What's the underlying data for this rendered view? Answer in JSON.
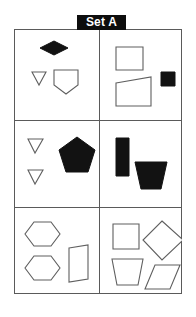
{
  "figure": {
    "title": "Set A",
    "colors": {
      "banner_background": "#0d0d0d",
      "banner_text": "#ffffff",
      "grid_line": "#5a5a5a",
      "shape_outline_stroke": "#5f5f5f",
      "shape_fill_black": "#121212",
      "shape_fill_white": "#ffffff",
      "page_background": "#ffffff"
    },
    "grid": {
      "rows": 3,
      "columns": 2,
      "x": 14,
      "y": 29,
      "width": 168,
      "height": 265,
      "divider_x": 84,
      "divider_y_1": 90,
      "divider_y_2": 177
    },
    "cells": [
      {
        "id": "cell-1",
        "position": "top-left",
        "row": 1,
        "column": 1,
        "shape_count": 3,
        "shapes": [
          {
            "name": "diamond",
            "fill": "black",
            "points": "24,17 38,10 52,17 38,24"
          },
          {
            "name": "triangle-down",
            "fill": "white",
            "points": "16,41 30,41 23,54"
          },
          {
            "name": "pentagon-shield",
            "fill": "white",
            "points": "38,39 62,39 62,54 50,63 38,54"
          }
        ]
      },
      {
        "id": "cell-2",
        "position": "top-right",
        "row": 1,
        "column": 2,
        "shape_count": 3,
        "shapes": [
          {
            "name": "rectangle",
            "fill": "white",
            "points": "16,16 43,16 43,39 16,39"
          },
          {
            "name": "square-small",
            "fill": "black",
            "points": "61,41 75,41 75,55 61,55"
          },
          {
            "name": "quadrilateral",
            "fill": "white",
            "points": "16,52 51,46 51,75 16,75"
          }
        ]
      },
      {
        "id": "cell-3",
        "position": "middle-left",
        "row": 2,
        "column": 1,
        "shape_count": 3,
        "shapes": [
          {
            "name": "triangle-down-upper",
            "fill": "white",
            "points": "12,17 27,17 19,31"
          },
          {
            "name": "triangle-down-lower",
            "fill": "white",
            "points": "12,48 27,48 19,62"
          },
          {
            "name": "pentagon",
            "fill": "black",
            "points": "61,15 79,28 72,50 50,50 43,28"
          }
        ]
      },
      {
        "id": "cell-4",
        "position": "middle-right",
        "row": 2,
        "column": 2,
        "shape_count": 2,
        "shapes": [
          {
            "name": "rectangle-tall",
            "fill": "black",
            "points": "16,16 29,16 29,54 16,54"
          },
          {
            "name": "trapezoid",
            "fill": "black",
            "points": "35,40 67,40 61,67 41,67"
          }
        ]
      },
      {
        "id": "cell-5",
        "position": "bottom-left",
        "row": 3,
        "column": 1,
        "shape_count": 3,
        "shapes": [
          {
            "name": "hexagon-upper",
            "fill": "white",
            "points": "18,13 35,13 44,25 35,37 18,37 9,25"
          },
          {
            "name": "hexagon-lower",
            "fill": "white",
            "points": "18,47 35,47 44,59 35,71 18,71 9,59"
          },
          {
            "name": "rectangle-slanted",
            "fill": "white",
            "points": "53,39 72,36 72,70 53,73"
          }
        ]
      },
      {
        "id": "cell-6",
        "position": "bottom-right",
        "row": 3,
        "column": 2,
        "shape_count": 4,
        "shapes": [
          {
            "name": "square",
            "fill": "white",
            "points": "13,15 39,15 39,40 13,40"
          },
          {
            "name": "diamond",
            "fill": "white",
            "points": "62,12 83,31 62,51 43,31"
          },
          {
            "name": "trapezoid",
            "fill": "white",
            "points": "12,50 43,50 38,76 17,76"
          },
          {
            "name": "parallelogram",
            "fill": "white",
            "points": "55,56 80,56 70,80 45,80"
          }
        ]
      }
    ]
  }
}
